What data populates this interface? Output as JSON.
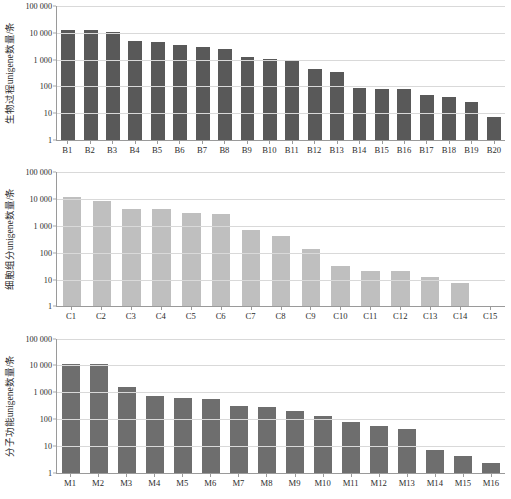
{
  "figure": {
    "background": "#ffffff",
    "panel_count": 3
  },
  "chart_data": [
    {
      "type": "bar",
      "id": "biological-process",
      "title": "",
      "xlabel": "",
      "ylabel": "生物过程unigene数量/条",
      "ylim": [
        1,
        100000
      ],
      "yscale": "log",
      "ytick_labels": [
        "100 000",
        "10 000",
        "1 000",
        "100",
        "10",
        "1"
      ],
      "ytick_values": [
        100000,
        10000,
        1000,
        100,
        10,
        1
      ],
      "grid": true,
      "legend": "none",
      "bar_color": "#595959",
      "categories": [
        "B1",
        "B2",
        "B3",
        "B4",
        "B5",
        "B6",
        "B7",
        "B8",
        "B9",
        "B10",
        "B11",
        "B12",
        "B13",
        "B14",
        "B15",
        "B16",
        "B17",
        "B18",
        "B19",
        "B20"
      ],
      "values": [
        13000,
        12500,
        10500,
        5100,
        4700,
        3400,
        2900,
        2400,
        1250,
        1050,
        980,
        440,
        360,
        85,
        78,
        77,
        46,
        39,
        27,
        7
      ]
    },
    {
      "type": "bar",
      "id": "cellular-component",
      "title": "",
      "xlabel": "",
      "ylabel": "细胞组分unigene数量/条",
      "ylim": [
        1,
        100000
      ],
      "yscale": "log",
      "ytick_labels": [
        "100 000",
        "10 000",
        "1 000",
        "100",
        "10",
        "1"
      ],
      "ytick_values": [
        100000,
        10000,
        1000,
        100,
        10,
        1
      ],
      "grid": true,
      "legend": "none",
      "bar_color": "#bfbfbf",
      "categories": [
        "C1",
        "C2",
        "C3",
        "C4",
        "C5",
        "C6",
        "C7",
        "C8",
        "C9",
        "C10",
        "C11",
        "C12",
        "C13",
        "C14",
        "C15"
      ],
      "values": [
        12500,
        8800,
        4300,
        4200,
        3100,
        2700,
        700,
        430,
        135,
        33,
        21,
        21,
        12.5,
        7.5,
        0
      ]
    },
    {
      "type": "bar",
      "id": "molecular-function",
      "title": "",
      "xlabel": "",
      "ylabel": "分子功能unigene数量/条",
      "ylim": [
        1,
        100000
      ],
      "yscale": "log",
      "ytick_labels": [
        "100 000",
        "10 000",
        "1 000",
        "100",
        "10",
        "1"
      ],
      "ytick_values": [
        100000,
        10000,
        1000,
        100,
        10,
        1
      ],
      "grid": true,
      "legend": "none",
      "bar_color": "#6e6e6e",
      "categories": [
        "M1",
        "M2",
        "M3",
        "M4",
        "M5",
        "M6",
        "M7",
        "M8",
        "M9",
        "M10",
        "M11",
        "M12",
        "M13",
        "M14",
        "M15",
        "M16"
      ],
      "values": [
        11800,
        11700,
        1550,
        720,
        620,
        560,
        295,
        280,
        195,
        125,
        78,
        57,
        43,
        7.3,
        4.3,
        2.2
      ]
    }
  ]
}
